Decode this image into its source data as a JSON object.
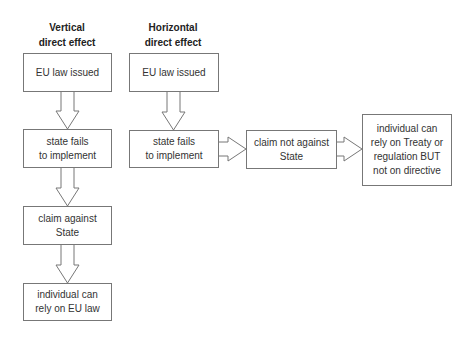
{
  "vertical": {
    "title_line1": "Vertical",
    "title_line2": "direct effect",
    "steps": [
      {
        "line1": "EU law issued",
        "line2": ""
      },
      {
        "line1": "state fails",
        "line2": "to implement"
      },
      {
        "line1": "claim against",
        "line2": "State"
      },
      {
        "line1": "individual can",
        "line2": "rely on EU law"
      }
    ]
  },
  "horizontal": {
    "title_line1": "Horizontal",
    "title_line2": "direct effect",
    "steps": [
      {
        "line1": "EU law issued"
      },
      {
        "line1": "state fails",
        "line2": "to implement"
      },
      {
        "line1": "claim not against",
        "line2": "State"
      },
      {
        "line1": "individual can",
        "line2": "rely on Treaty or",
        "line3": "regulation BUT",
        "line4": "not on directive"
      }
    ]
  },
  "colors": {
    "stroke": "#777777",
    "text": "#333333",
    "background": "#ffffff"
  }
}
